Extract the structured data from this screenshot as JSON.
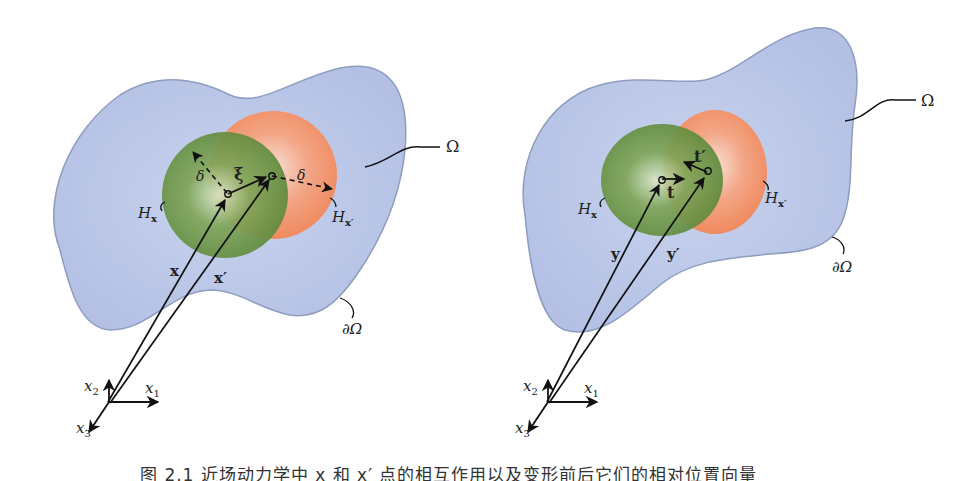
{
  "figure": {
    "left_panel": {
      "domain_label": "Ω",
      "boundary_label": "∂Ω",
      "horizon_x_label": "H",
      "horizon_x_sub": "x",
      "horizon_xp_label": "H",
      "horizon_xp_sub": "x′",
      "bond_label": "ξ",
      "delta_left": "δ",
      "delta_right": "δ",
      "vec_x": "x",
      "vec_xp": "x′",
      "axis_x1": "x",
      "axis_x1_sub": "1",
      "axis_x2": "x",
      "axis_x2_sub": "2",
      "axis_x3": "x",
      "axis_x3_sub": "3"
    },
    "right_panel": {
      "domain_label": "Ω",
      "boundary_label": "∂Ω",
      "horizon_x_label": "H",
      "horizon_x_sub": "x",
      "horizon_xp_label": "H",
      "horizon_xp_sub": "x′",
      "force_t": "t",
      "force_tp": "t′",
      "vec_y": "y",
      "vec_yp": "y′",
      "axis_x1": "x",
      "axis_x1_sub": "1",
      "axis_x2": "x",
      "axis_x2_sub": "2",
      "axis_x3": "x",
      "axis_x3_sub": "3"
    },
    "colors": {
      "domain_fill": "#b9c6e6",
      "domain_stroke": "#8e9cc0",
      "horizon_green": "#6f9a4a",
      "horizon_orange": "#f0936a",
      "ink": "#111111"
    },
    "caption": "图 2.1  近场动力学中 x 和 x′ 点的相互作用以及变形前后它们的相对位置向量"
  }
}
